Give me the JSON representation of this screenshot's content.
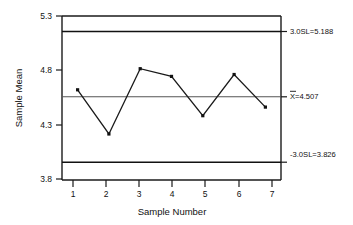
{
  "chart_data": {
    "type": "line",
    "title": "",
    "subtitle": "",
    "xlabel": "Sample Number",
    "ylabel": "Sample Mean",
    "x": [
      1,
      2,
      3,
      4,
      5,
      6,
      7
    ],
    "categories": [
      "1",
      "2",
      "3",
      "4",
      "5",
      "6",
      "7"
    ],
    "values": [
      4.58,
      4.12,
      4.8,
      4.72,
      4.31,
      4.74,
      4.4
    ],
    "series": [
      {
        "name": "Sample Mean",
        "values": [
          4.58,
          4.12,
          4.8,
          4.72,
          4.31,
          4.74,
          4.4
        ]
      }
    ],
    "xlim": [
      0.5,
      7.5
    ],
    "ylim": [
      3.64,
      5.35
    ],
    "ytick_labels": [
      "3.8",
      "4.3",
      "4.8",
      "5.3"
    ],
    "yticks": [
      3.8,
      4.3,
      4.8,
      5.3
    ],
    "xtick_labels": [
      "1",
      "2",
      "3",
      "4",
      "5",
      "6",
      "7"
    ],
    "xticks": [
      1,
      2,
      3,
      4,
      5,
      6,
      7
    ],
    "grid": false,
    "legend": "none",
    "marker": "square",
    "control_limits": {
      "upper": {
        "label": "3.0SL=5.188",
        "value": 5.188,
        "name": "upper-control-limit"
      },
      "center": {
        "label_prefix": "X",
        "label_suffix": "=4.507",
        "label": "X̄=4.507",
        "value": 4.507,
        "name": "center-line"
      },
      "lower": {
        "label": "-3.0SL=3.826",
        "value": 3.826,
        "name": "lower-control-limit"
      }
    },
    "colors": {
      "series": "#1a1a1a",
      "limit": "#111111",
      "center": "#555555",
      "axis": "#1a1a1a",
      "background": "#ffffff"
    }
  }
}
